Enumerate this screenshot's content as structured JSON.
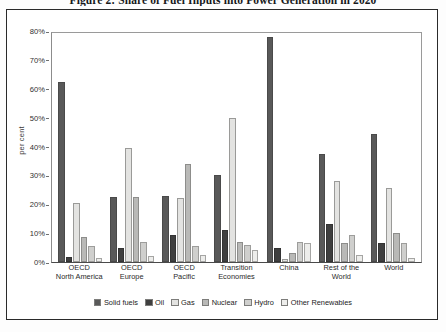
{
  "title": "Figure 2: Share of Fuel Inputs into Power Generation in 2020",
  "axis": {
    "ylabel": "per cent",
    "yticks": [
      "80%",
      "70%",
      "60%",
      "50%",
      "40%",
      "30%",
      "20%",
      "10%",
      "0%"
    ]
  },
  "legend": {
    "items": [
      {
        "label": "Solid fuels",
        "color": "#595959"
      },
      {
        "label": "Oil",
        "color": "#3f3f3f"
      },
      {
        "label": "Gas",
        "color": "#e3e3e1"
      },
      {
        "label": "Nuclear",
        "color": "#b9b9b7"
      },
      {
        "label": "Hydro",
        "color": "#cfcfcd"
      },
      {
        "label": "Other Renewables",
        "color": "#ededeb"
      }
    ]
  },
  "chart_data": {
    "type": "bar",
    "title": "Figure 2: Share of Fuel Inputs into Power Generation in 2020",
    "xlabel": "",
    "ylabel": "per cent",
    "ylim": [
      0,
      80
    ],
    "ytick_step": 10,
    "grid": false,
    "legend_position": "bottom",
    "categories": [
      "OECD\nNorth America",
      "OECD\nEurope",
      "OECD\nPacific",
      "Transition\nEconomies",
      "China",
      "Rest of the\nWorld",
      "World"
    ],
    "series": [
      {
        "name": "Solid fuels",
        "color": "#595959",
        "values": [
          62.5,
          22.5,
          23.0,
          30.0,
          78.0,
          37.5,
          44.5
        ]
      },
      {
        "name": "Oil",
        "color": "#3f3f3f",
        "values": [
          1.8,
          5.0,
          9.5,
          11.0,
          5.0,
          13.0,
          6.5
        ]
      },
      {
        "name": "Gas",
        "color": "#e3e3e1",
        "values": [
          20.5,
          39.5,
          22.0,
          50.0,
          1.0,
          28.0,
          25.5
        ]
      },
      {
        "name": "Nuclear",
        "color": "#b9b9b7",
        "values": [
          8.5,
          22.5,
          34.0,
          7.0,
          3.0,
          6.5,
          10.0
        ]
      },
      {
        "name": "Hydro",
        "color": "#cfcfcd",
        "values": [
          5.5,
          7.0,
          5.5,
          6.0,
          7.0,
          9.5,
          6.5
        ]
      },
      {
        "name": "Other Renewables",
        "color": "#ededeb",
        "values": [
          1.5,
          2.0,
          2.5,
          4.0,
          6.5,
          2.5,
          1.5
        ]
      }
    ]
  }
}
